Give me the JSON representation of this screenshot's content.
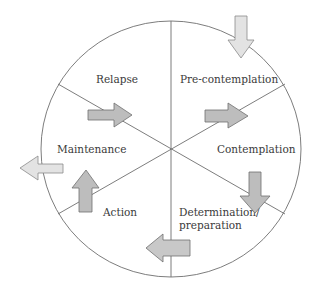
{
  "diagram": {
    "title": "",
    "type": "cycle",
    "stages": [
      {
        "id": "relapse",
        "label": "Relapse"
      },
      {
        "id": "precontemplation",
        "label": "Pre-contemplation"
      },
      {
        "id": "contemplation",
        "label": "Contemplation"
      },
      {
        "id": "determination",
        "label_line1": "Determination/",
        "label_line2": "preparation"
      },
      {
        "id": "action",
        "label": "Action"
      },
      {
        "id": "maintenance",
        "label": "Maintenance"
      }
    ],
    "arrows": [
      {
        "id": "entry",
        "direction": "down",
        "style": "light",
        "meaning": "enter cycle into Pre-contemplation"
      },
      {
        "id": "relapse-to-precontemplation",
        "direction": "right",
        "style": "dark"
      },
      {
        "id": "precontemplation-to-contemplation",
        "direction": "right",
        "style": "dark"
      },
      {
        "id": "contemplation-to-determination",
        "direction": "down",
        "style": "dark"
      },
      {
        "id": "determination-to-action",
        "direction": "left",
        "style": "light"
      },
      {
        "id": "action-to-maintenance",
        "direction": "up",
        "style": "dark"
      },
      {
        "id": "exit",
        "direction": "left",
        "style": "light",
        "meaning": "exit cycle from Maintenance"
      }
    ],
    "colors": {
      "line": "#6e6e6e",
      "arrow_dark_fill": "#bdbdbd",
      "arrow_light_fill": "#e3e3e3",
      "text": "#3a3a3a"
    }
  }
}
